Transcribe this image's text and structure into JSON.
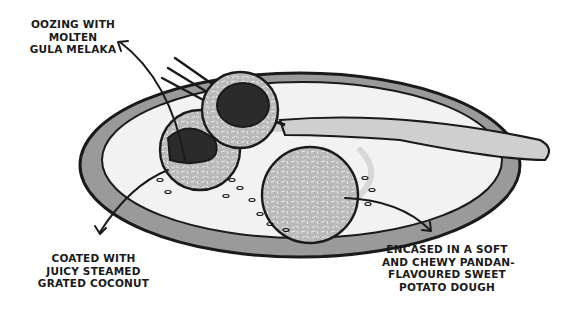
{
  "illustration": {
    "subject": "onde-onde dessert in a bowl with a fork",
    "colors": {
      "ink": "#1a1a1a",
      "bowl_rim": "#8a8a8a",
      "bowl_inner": "#f2f2f2",
      "coconut_coating": "#bdbdbd",
      "filling": "#2b2b2b",
      "fork": "#cfcfcf"
    }
  },
  "annotations": [
    {
      "id": "filling",
      "lines": [
        "OOZING WITH",
        "MOLTEN",
        "GULA MELAKA"
      ]
    },
    {
      "id": "coating",
      "lines": [
        "COATED WITH",
        "JUICY STEAMED",
        "GRATED COCONUT"
      ]
    },
    {
      "id": "dough",
      "lines": [
        "ENCASED IN A SOFT",
        "AND CHEWY PANDAN-",
        "FLAVOURED SWEET",
        "POTATO DOUGH"
      ]
    }
  ]
}
